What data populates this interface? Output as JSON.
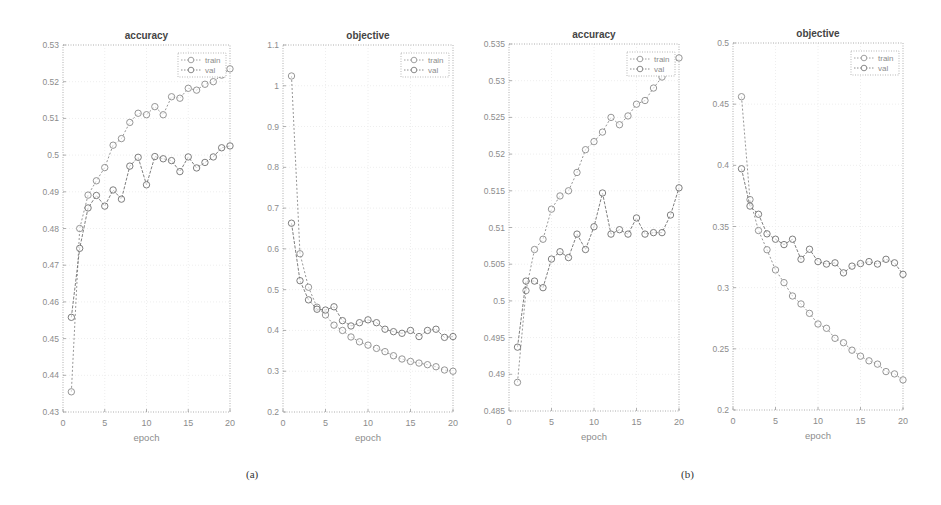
{
  "captions": {
    "a": "(a)",
    "b": "(b)"
  },
  "colors": {
    "train": "#8a8a8a",
    "val": "#6f6f6f",
    "axis": "#9a9a9a",
    "text": "#8c8c8c",
    "title": "#444444"
  },
  "chart_data": [
    {
      "type": "line",
      "panel": "a",
      "title": "accuracy",
      "xlabel": "epoch",
      "ylabel": "",
      "xlim": [
        0,
        20
      ],
      "ylim": [
        0.43,
        0.53
      ],
      "xticks": [
        0,
        5,
        10,
        15,
        20
      ],
      "xtick_labels": [
        "0",
        "5",
        "10",
        "15",
        "20"
      ],
      "yticks": [
        0.43,
        0.44,
        0.45,
        0.46,
        0.47,
        0.48,
        0.49,
        0.5,
        0.51,
        0.52,
        0.53
      ],
      "ytick_labels": [
        "0.43",
        "0.44",
        "0.45",
        "0.46",
        "0.47",
        "0.48",
        "0.49",
        "0.5",
        "0.51",
        "0.52",
        "0.53"
      ],
      "grid": true,
      "legend": {
        "position": "top-right",
        "entries": [
          "train",
          "val"
        ]
      },
      "x": [
        1,
        2,
        3,
        4,
        5,
        6,
        7,
        8,
        9,
        10,
        11,
        12,
        13,
        14,
        15,
        16,
        17,
        18,
        19,
        20
      ],
      "series": [
        {
          "name": "train",
          "values": [
            0.4355,
            0.48,
            0.4891,
            0.493,
            0.4966,
            0.5027,
            0.5045,
            0.5089,
            0.5114,
            0.511,
            0.5132,
            0.511,
            0.5159,
            0.5155,
            0.5182,
            0.5177,
            0.5193,
            0.52,
            0.5218,
            0.5235
          ]
        },
        {
          "name": "val",
          "values": [
            0.4558,
            0.4746,
            0.4856,
            0.489,
            0.4861,
            0.4905,
            0.488,
            0.497,
            0.4994,
            0.4919,
            0.4996,
            0.499,
            0.4985,
            0.4955,
            0.4995,
            0.4965,
            0.498,
            0.4995,
            0.502,
            0.5025
          ]
        }
      ]
    },
    {
      "type": "line",
      "panel": "a",
      "title": "objective",
      "xlabel": "",
      "ylabel": "",
      "xlim": [
        0,
        20
      ],
      "ylim": [
        0.2,
        1.1
      ],
      "xticks": [
        0,
        5,
        10,
        15,
        20
      ],
      "xtick_labels": [
        "0",
        "5",
        "10",
        "15",
        "20"
      ],
      "yticks": [
        0.2,
        0.3,
        0.4,
        0.5,
        0.6,
        0.7,
        0.8,
        0.9,
        1.0,
        1.1
      ],
      "ytick_labels": [
        "0.2",
        "0.3",
        "0.4",
        "0.5",
        "0.6",
        "0.7",
        "0.8",
        "0.9",
        "1",
        "1.1"
      ],
      "grid": true,
      "legend": {
        "position": "top-right",
        "entries": [
          "train",
          "val"
        ]
      },
      "x": [
        1,
        2,
        3,
        4,
        5,
        6,
        7,
        8,
        9,
        10,
        11,
        12,
        13,
        14,
        15,
        16,
        17,
        18,
        19,
        20
      ],
      "series": [
        {
          "name": "train",
          "values": [
            1.024,
            0.588,
            0.506,
            0.457,
            0.438,
            0.413,
            0.4,
            0.384,
            0.372,
            0.364,
            0.356,
            0.348,
            0.338,
            0.33,
            0.324,
            0.32,
            0.316,
            0.311,
            0.303,
            0.3
          ]
        },
        {
          "name": "val",
          "values": [
            0.663,
            0.522,
            0.475,
            0.452,
            0.45,
            0.458,
            0.424,
            0.411,
            0.419,
            0.426,
            0.419,
            0.403,
            0.397,
            0.393,
            0.4,
            0.385,
            0.4,
            0.403,
            0.383,
            0.385
          ]
        }
      ]
    },
    {
      "type": "line",
      "panel": "b",
      "title": "accuracy",
      "xlabel": "epoch",
      "ylabel": "",
      "xlim": [
        0,
        20
      ],
      "ylim": [
        0.485,
        0.535
      ],
      "xticks": [
        0,
        5,
        10,
        15,
        20
      ],
      "xtick_labels": [
        "0",
        "5",
        "10",
        "15",
        "20"
      ],
      "yticks": [
        0.485,
        0.49,
        0.495,
        0.5,
        0.505,
        0.51,
        0.515,
        0.52,
        0.525,
        0.53,
        0.535
      ],
      "ytick_labels": [
        "0.485",
        "0.49",
        "0.495",
        "0.5",
        "0.505",
        "0.51",
        "0.515",
        "0.52",
        "0.525",
        "0.53",
        "0.535"
      ],
      "grid": true,
      "legend": {
        "position": "top-right",
        "entries": [
          "train",
          "val"
        ]
      },
      "x": [
        1,
        2,
        3,
        4,
        5,
        6,
        7,
        8,
        9,
        10,
        11,
        12,
        13,
        14,
        15,
        16,
        17,
        18,
        19,
        20
      ],
      "series": [
        {
          "name": "train",
          "values": [
            0.4889,
            0.5014,
            0.507,
            0.5084,
            0.5125,
            0.5143,
            0.515,
            0.5175,
            0.5206,
            0.5217,
            0.523,
            0.525,
            0.524,
            0.5252,
            0.5268,
            0.5273,
            0.529,
            0.5305,
            0.5318,
            0.5331
          ]
        },
        {
          "name": "val",
          "values": [
            0.4937,
            0.5027,
            0.5027,
            0.5018,
            0.5057,
            0.5067,
            0.5059,
            0.5091,
            0.507,
            0.5101,
            0.5147,
            0.5091,
            0.5097,
            0.5091,
            0.5113,
            0.5091,
            0.5093,
            0.5093,
            0.5117,
            0.5154
          ]
        }
      ]
    },
    {
      "type": "line",
      "panel": "b",
      "title": "objective",
      "xlabel": "epoch",
      "ylabel": "",
      "xlim": [
        0,
        20
      ],
      "ylim": [
        0.2,
        0.5
      ],
      "xticks": [
        0,
        5,
        10,
        15,
        20
      ],
      "xtick_labels": [
        "0",
        "5",
        "10",
        "15",
        "20"
      ],
      "yticks": [
        0.2,
        0.25,
        0.3,
        0.35,
        0.4,
        0.45,
        0.5
      ],
      "ytick_labels": [
        "0.2",
        "0.25",
        "0.3",
        "0.35",
        "0.4",
        "0.45",
        "0.5"
      ],
      "grid": true,
      "legend": {
        "position": "top-right",
        "entries": [
          "train",
          "val"
        ]
      },
      "x": [
        1,
        2,
        3,
        4,
        5,
        6,
        7,
        8,
        9,
        10,
        11,
        12,
        13,
        14,
        15,
        16,
        17,
        18,
        19,
        20
      ],
      "series": [
        {
          "name": "train",
          "values": [
            0.4561,
            0.372,
            0.3467,
            0.331,
            0.3145,
            0.3041,
            0.2932,
            0.2867,
            0.279,
            0.2703,
            0.2668,
            0.2586,
            0.255,
            0.2489,
            0.244,
            0.2402,
            0.2375,
            0.2314,
            0.2295,
            0.2246
          ]
        },
        {
          "name": "val",
          "values": [
            0.3972,
            0.3667,
            0.36,
            0.344,
            0.3396,
            0.3352,
            0.3396,
            0.3232,
            0.3314,
            0.3213,
            0.3193,
            0.3203,
            0.3121,
            0.3176,
            0.3197,
            0.3213,
            0.3193,
            0.3232,
            0.3203,
            0.3109
          ]
        }
      ]
    }
  ]
}
